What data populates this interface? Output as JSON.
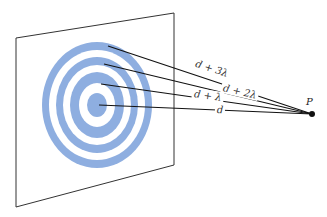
{
  "diagram": {
    "colors": {
      "ring": "#8eaee0",
      "plane_edge": "#333333",
      "ray": "#111111",
      "point": "#111111"
    },
    "plane": {
      "corners": [
        [
          16,
          38
        ],
        [
          174,
          13
        ],
        [
          174,
          165
        ],
        [
          16,
          207
        ]
      ]
    },
    "zone_plate": {
      "center": [
        97,
        105
      ],
      "rings": [
        {
          "rx": 55,
          "ry": 63
        },
        {
          "rx": 41,
          "ry": 48
        },
        {
          "rx": 27,
          "ry": 33
        },
        {
          "rx": 10,
          "ry": 12
        }
      ],
      "gaps": [
        {
          "rx": 48,
          "ry": 55
        },
        {
          "rx": 34,
          "ry": 40
        },
        {
          "rx": 18,
          "ry": 22
        }
      ]
    },
    "point": {
      "label": "P",
      "x": 312,
      "y": 114
    },
    "paths": [
      {
        "label": "d + 3λ",
        "from": [
          108,
          46
        ],
        "label_pos": [
          213,
          71
        ],
        "angle": 21
      },
      {
        "label": "d + 2λ",
        "from": [
          104,
          64
        ],
        "label_pos": [
          240,
          91
        ],
        "angle": 15
      },
      {
        "label": "d + λ",
        "from": [
          101,
          84
        ],
        "label_pos": [
          208,
          96
        ],
        "angle": 9
      },
      {
        "label": "d",
        "from": [
          99,
          105
        ],
        "label_pos": [
          220,
          110
        ],
        "angle": 3
      }
    ]
  }
}
